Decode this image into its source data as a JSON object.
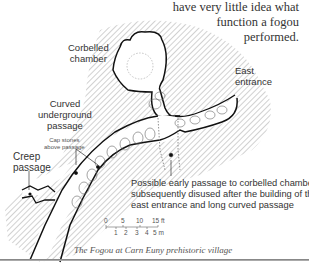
{
  "intro_text": {
    "lines": [
      "have very little idea what",
      "function a fogou",
      "performed."
    ]
  },
  "labels": {
    "corbelled_chamber": [
      "Corbelled",
      "chamber"
    ],
    "east_entrance": [
      "East",
      "entrance"
    ],
    "curved_passage": [
      "Curved",
      "underground",
      "passage"
    ],
    "cap_stones": [
      "Cap stones",
      "above passage"
    ],
    "creep_passage": [
      "Creep",
      "passage"
    ]
  },
  "note": {
    "lines": [
      "Possible early passage to corbelled chamber",
      "subsequently disused after the building of the",
      "east entrance and long curved passage"
    ]
  },
  "scale": {
    "feet_ticks": [
      "0",
      "5",
      "10",
      "15 ft"
    ],
    "metre_ticks": [
      "1",
      "2",
      "3",
      "4",
      "5 m"
    ]
  },
  "caption": "The Fogou at Carn Euny prehistoric village",
  "colors": {
    "outline": "#111111",
    "hatch": "#9a9a9a",
    "dotted": "#777777"
  }
}
